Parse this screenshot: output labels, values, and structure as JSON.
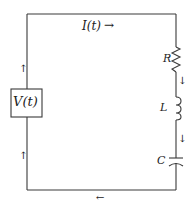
{
  "diagram": {
    "type": "series RLC circuit",
    "colors": {
      "wire": "#3a3a3a",
      "text": "#222222",
      "background": "#ffffff"
    },
    "source": {
      "label": "V(t)"
    },
    "current": {
      "label": "I(t)",
      "arrow": "→"
    },
    "components": [
      {
        "id": "resistor",
        "label": "R"
      },
      {
        "id": "inductor",
        "label": "L"
      },
      {
        "id": "capacitor",
        "label": "C"
      }
    ],
    "arrows": {
      "left_upper": "↑",
      "left_lower": "↑",
      "right_after_r": "↓",
      "right_after_l": "↓",
      "bottom": "←"
    }
  }
}
